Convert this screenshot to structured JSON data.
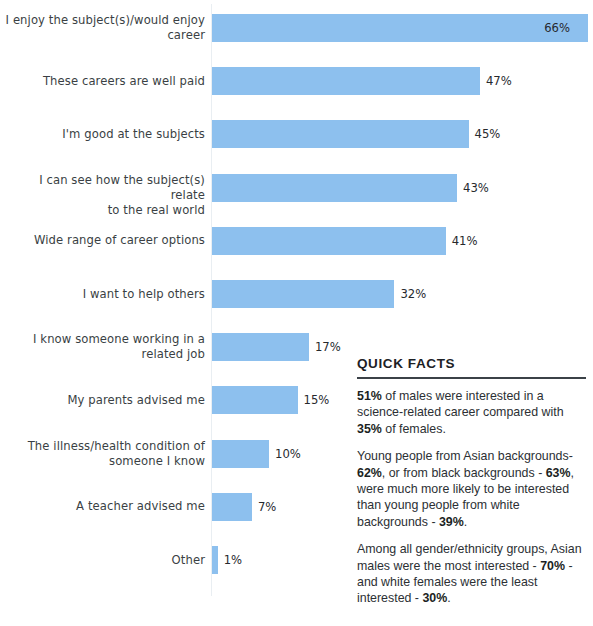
{
  "chart_data": {
    "type": "bar",
    "orientation": "horizontal",
    "title": "",
    "subtitle": "",
    "xlabel": "",
    "ylabel": "",
    "xlim": [
      0,
      66
    ],
    "grid": false,
    "legend": null,
    "bar_color": "#8DC0EE",
    "value_suffix": "%",
    "categories": [
      "I enjoy the subject(s)/would enjoy career",
      "These careers are well paid",
      "I'm good at the subjects",
      "I can see how the subject(s) relate to the real world",
      "Wide range of career options",
      "I want to help others",
      "I know someone working in a related job",
      "My parents advised me",
      "The illness/health condition of someone I know",
      "A teacher advised me",
      "Other"
    ],
    "values": [
      66,
      47,
      45,
      43,
      41,
      32,
      17,
      15,
      10,
      7,
      1
    ],
    "value_labels": [
      "66%",
      "47%",
      "45%",
      "43%",
      "41%",
      "32%",
      "17%",
      "15%",
      "10%",
      "7%",
      "1%"
    ],
    "label_lines": [
      [
        "I enjoy the subject(s)/would enjoy",
        "career"
      ],
      [
        "These careers are well paid"
      ],
      [
        "I'm good at the subjects"
      ],
      [
        "I can see how the subject(s) relate",
        "to the real world"
      ],
      [
        "Wide range of career options"
      ],
      [
        "I want to help others"
      ],
      [
        "I know someone working in a",
        "related job"
      ],
      [
        "My parents advised me"
      ],
      [
        "The illness/health condition of",
        "someone I know"
      ],
      [
        "A teacher advised me"
      ],
      [
        "Other"
      ]
    ],
    "value_label_placement": [
      "inside",
      "outside",
      "outside",
      "outside",
      "outside",
      "outside",
      "outside",
      "outside",
      "outside",
      "outside",
      "outside"
    ]
  },
  "quick_facts": {
    "title": "QUICK FACTS",
    "paragraphs": [
      {
        "id": "fact-gender",
        "segments": [
          {
            "text": "51%",
            "bold": true
          },
          {
            "text": " of males were interested in a science-related career compared with ",
            "bold": false
          },
          {
            "text": "35%",
            "bold": true
          },
          {
            "text": " of females.",
            "bold": false
          }
        ]
      },
      {
        "id": "fact-ethnicity",
        "segments": [
          {
            "text": "Young people from Asian backgrounds-",
            "bold": false
          },
          {
            "text": "62%",
            "bold": true
          },
          {
            "text": ", or from black backgrounds - ",
            "bold": false
          },
          {
            "text": "63%",
            "bold": true
          },
          {
            "text": ", were much more likely to be interested than young people from white backgrounds - ",
            "bold": false
          },
          {
            "text": "39%",
            "bold": true
          },
          {
            "text": ".",
            "bold": false
          }
        ]
      },
      {
        "id": "fact-groups",
        "segments": [
          {
            "text": "Among all gender/ethnicity groups, Asian males were the most interested - ",
            "bold": false
          },
          {
            "text": "70%",
            "bold": true
          },
          {
            "text": " - and white females were the least interested - ",
            "bold": false
          },
          {
            "text": "30%",
            "bold": true
          },
          {
            "text": ".",
            "bold": false
          }
        ]
      }
    ]
  }
}
